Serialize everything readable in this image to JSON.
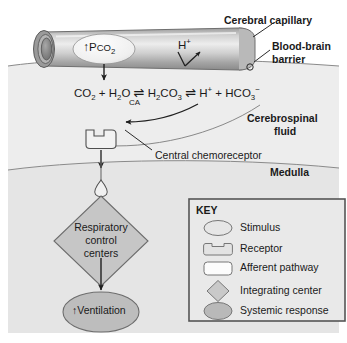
{
  "figure": {
    "title_labels": {
      "cerebral_capillary": "Cerebral capillary",
      "blood_brain_barrier_line1": "Blood-brain",
      "blood_brain_barrier_line2": "barrier",
      "cerebrospinal_fluid_line1": "Cerebrospinal",
      "cerebrospinal_fluid_line2": "fluid",
      "medulla": "Medulla"
    },
    "capillary": {
      "stimulus_arrow": "↑",
      "stimulus_text_main": "P",
      "stimulus_text_sub": "CO",
      "stimulus_text_sub2": "2",
      "stimulus_full": "↑PCO2",
      "hydrogen_ion": "H",
      "hydrogen_ion_charge": "+"
    },
    "reaction": {
      "co2": "CO",
      "co2_sub": "2",
      "plus1": "+",
      "h2o": "H",
      "h2o_sub1": "2",
      "h2o_o": "O",
      "arrow1": "⇌",
      "enzyme": "CA",
      "h2co3": "H",
      "h2co3_sub1": "2",
      "h2co3_c": "CO",
      "h2co3_sub2": "3",
      "arrow2": "⇌",
      "hplus": "H",
      "hplus_charge": "+",
      "plus2": "+",
      "hco3": "HCO",
      "hco3_sub": "3",
      "hco3_charge": "−",
      "full": "CO2 + H2O ⇌ H2CO3 ⇌ H+ + HCO3−"
    },
    "flow": {
      "receptor_label": "Central chemoreceptor",
      "integrating_line1": "Respiratory",
      "integrating_line2": "control",
      "integrating_line3": "centers",
      "response_arrow": "↑",
      "response_text": "Ventilation"
    }
  },
  "legend": {
    "title": "KEY",
    "items": [
      {
        "shape": "ellipse-light",
        "label": "Stimulus"
      },
      {
        "shape": "receptor-notched",
        "label": "Receptor"
      },
      {
        "shape": "rounded-rect-white",
        "label": "Afferent pathway"
      },
      {
        "shape": "diamond-gray",
        "label": "Integrating center"
      },
      {
        "shape": "ellipse-dark",
        "label": "Systemic response"
      }
    ]
  },
  "colors": {
    "background_csf": "#ececec",
    "background_medulla": "#e4e4e4",
    "capillary_mid": "#d8d8d8",
    "capillary_dark": "#8d8d8d",
    "shape_light": "#e8e8e8",
    "shape_gray": "#c9c9c9",
    "shape_dark": "#b6b6b6",
    "stroke": "#4a4a4a",
    "text": "#1a1a1a",
    "legend_border": "#595959",
    "legend_bg": "#e9e9e9"
  },
  "icons": {
    "down_arrow": "down-arrow-icon",
    "up_arrow": "up-arrow-icon",
    "equilibrium_arrow": "equilibrium-arrow-icon",
    "leader_line": "leader-line-icon"
  }
}
